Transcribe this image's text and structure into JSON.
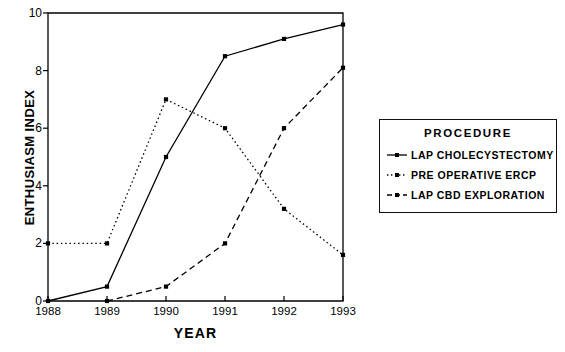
{
  "chart_data": {
    "type": "line",
    "title": "",
    "xlabel": "YEAR",
    "ylabel": "ENTHUSIASM INDEX",
    "x": [
      1988,
      1989,
      1990,
      1991,
      1992,
      1993
    ],
    "xticklabels": [
      "1988",
      "1989",
      "1990",
      "1991",
      "1992",
      "1993"
    ],
    "yticks": [
      0,
      2,
      4,
      6,
      8,
      10
    ],
    "yticklabels": [
      "0",
      "2",
      "4",
      "6",
      "8",
      "10"
    ],
    "xlim": [
      1988,
      1993
    ],
    "ylim": [
      0,
      10
    ],
    "grid": false,
    "legend_position": "right-outside",
    "legend_title": "PROCEDURE",
    "series": [
      {
        "name": "LAP CHOLECYSTECTOMY",
        "linestyle": "solid",
        "marker": "square",
        "color": "#000000",
        "x": [
          1988,
          1989,
          1990,
          1991,
          1992,
          1993
        ],
        "values": [
          0.0,
          0.5,
          5.0,
          8.5,
          9.1,
          9.6
        ]
      },
      {
        "name": "PRE OPERATIVE ERCP",
        "linestyle": "dotted",
        "marker": "square",
        "color": "#000000",
        "x": [
          1988,
          1989,
          1990,
          1991,
          1992,
          1993
        ],
        "values": [
          2.0,
          2.0,
          7.0,
          6.0,
          3.2,
          1.6
        ]
      },
      {
        "name": "LAP CBD EXPLORATION",
        "linestyle": "dashed",
        "marker": "square",
        "color": "#000000",
        "x": [
          1989,
          1990,
          1991,
          1992,
          1993
        ],
        "values": [
          0.0,
          0.5,
          2.0,
          6.0,
          8.1
        ]
      }
    ]
  },
  "axes": {
    "ylabel": "ENTHUSIASM INDEX",
    "xlabel": "YEAR"
  },
  "legend": {
    "title": "PROCEDURE",
    "items": [
      {
        "label": "LAP CHOLECYSTECTOMY"
      },
      {
        "label": "PRE OPERATIVE ERCP"
      },
      {
        "label": "LAP CBD EXPLORATION"
      }
    ]
  }
}
